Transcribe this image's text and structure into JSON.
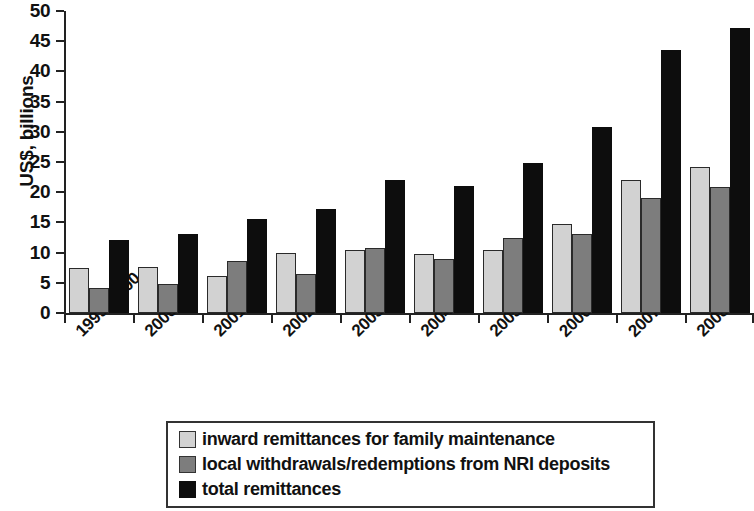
{
  "chart_data": {
    "type": "bar",
    "title": "",
    "subtitle": "",
    "xlabel": "",
    "ylabel": "US$, billions",
    "ylim": [
      0,
      50
    ],
    "ytick_step": 5,
    "yticks": [
      0,
      5,
      10,
      15,
      20,
      25,
      30,
      35,
      40,
      45,
      50
    ],
    "grid": false,
    "legend_position": "bottom",
    "categories": [
      "1999–2000",
      "2000–01",
      "2001–02",
      "2002–03",
      "2003–04",
      "2004–05",
      "2005–06",
      "2006–07",
      "2007–08",
      "2008–09"
    ],
    "category_footnotes": [
      "",
      "",
      "",
      "",
      "",
      "",
      "",
      "a",
      "a",
      ""
    ],
    "series": [
      {
        "name": "inward remittances for family maintenance",
        "color": "#d2d2d2",
        "values": [
          7.4,
          7.6,
          6.1,
          9.9,
          10.4,
          9.8,
          10.4,
          14.8,
          22.0,
          24.2
        ]
      },
      {
        "name": "local withdrawals/redemptions from NRI deposits",
        "color": "#7d7d7d",
        "values": [
          4.2,
          4.8,
          8.6,
          6.4,
          10.7,
          9.0,
          12.5,
          13.0,
          19.1,
          20.8
        ]
      },
      {
        "name": "total remittances",
        "color": "#0d0d0d",
        "values": [
          12.1,
          13.1,
          15.6,
          17.2,
          22.1,
          21.1,
          24.9,
          30.8,
          43.6,
          47.2
        ]
      }
    ]
  },
  "legend": {
    "items": [
      "inward remittances for family maintenance",
      "local withdrawals/redemptions from NRI deposits",
      "total remittances"
    ]
  }
}
